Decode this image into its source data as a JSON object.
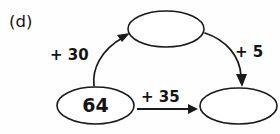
{
  "figure": {
    "part_label": "(d)",
    "type": "arrow-chain-diagram",
    "ink_color": "#1a1a1a",
    "background_color": "#fefefe"
  },
  "nodes": [
    {
      "id": "start",
      "value": "64",
      "filled": true,
      "position": "bottom-left"
    },
    {
      "id": "top",
      "value": "",
      "filled": false,
      "position": "top-middle"
    },
    {
      "id": "end",
      "value": "",
      "filled": false,
      "position": "bottom-right"
    }
  ],
  "arrows": [
    {
      "id": "arrow-plus-30",
      "label": "+ 30",
      "from": "start",
      "to": "top",
      "style": "curved"
    },
    {
      "id": "arrow-plus-5",
      "label": "+ 5",
      "from": "top",
      "to": "end",
      "style": "curved"
    },
    {
      "id": "arrow-plus-35",
      "label": "+ 35",
      "from": "start",
      "to": "end",
      "style": "straight"
    }
  ]
}
